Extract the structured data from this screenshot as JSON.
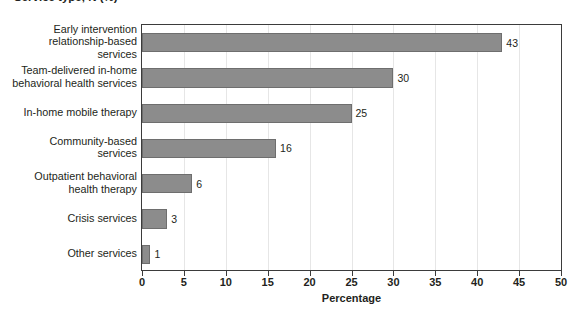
{
  "title": {
    "text": "Service type, N (%)",
    "visible_partial": true
  },
  "chart_data": {
    "type": "bar",
    "orientation": "horizontal",
    "title": "",
    "xlabel": "Percentage",
    "ylabel": "",
    "xlim": [
      0,
      50
    ],
    "xticks": [
      0,
      5,
      10,
      15,
      20,
      25,
      30,
      35,
      40,
      45,
      50
    ],
    "xtick_labels": [
      "0",
      "5",
      "10",
      "15",
      "20",
      "25",
      "30",
      "35",
      "40",
      "45",
      "50"
    ],
    "grid": true,
    "grid_axis": "x",
    "legend": null,
    "bar_color": "#8c8c8c",
    "bar_edge_color": "#6e6e6e",
    "categories": [
      "Early intervention relationship-based services",
      "Team-delivered in-home behavioral health services",
      "In-home mobile therapy",
      "Community-based services",
      "Outpatient behavioral health therapy",
      "Crisis services",
      "Other services"
    ],
    "category_lines": [
      [
        "Early intervention",
        "relationship-based",
        "services"
      ],
      [
        "Team-delivered in-home",
        "behavioral health services"
      ],
      [
        "In-home mobile therapy"
      ],
      [
        "Community-based",
        "services"
      ],
      [
        "Outpatient behavioral",
        "health therapy"
      ],
      [
        "Crisis services"
      ],
      [
        "Other services"
      ]
    ],
    "values": [
      43,
      30,
      25,
      16,
      6,
      3,
      1
    ],
    "data_labels": [
      "43",
      "30",
      "25",
      "16",
      "6",
      "3",
      "1"
    ]
  }
}
